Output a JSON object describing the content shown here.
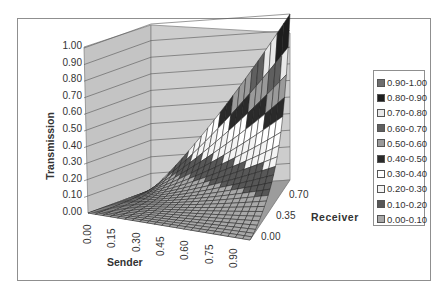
{
  "chart_data": {
    "type": "surface3d",
    "title": "",
    "xlabel": "Sender",
    "ylabel": "Transmission",
    "zlabel": "Receiver",
    "x_ticks": [
      "0.00",
      "0.15",
      "0.30",
      "0.45",
      "0.60",
      "0.75",
      "0.90"
    ],
    "z_ticks": [
      "0.00",
      "0.35",
      "0.70"
    ],
    "y_ticks": [
      "0.00",
      "0.10",
      "0.20",
      "0.30",
      "0.40",
      "0.50",
      "0.60",
      "0.70",
      "0.80",
      "0.90",
      "1.00"
    ],
    "ylim": [
      0,
      1
    ],
    "xlim": [
      0,
      1
    ],
    "zlim": [
      0,
      1
    ],
    "grid": true,
    "legend_position": "right",
    "legend": [
      {
        "label": "0.90-1.00",
        "color": "#6e6e6e"
      },
      {
        "label": "0.80-0.90",
        "color": "#1e1e1e"
      },
      {
        "label": "0.70-0.80",
        "color": "#e8e8e8"
      },
      {
        "label": "0.60-0.70",
        "color": "#5f5f5f"
      },
      {
        "label": "0.50-0.60",
        "color": "#9a9a9a"
      },
      {
        "label": "0.40-0.50",
        "color": "#2a2a2a"
      },
      {
        "label": "0.30-0.40",
        "color": "#ffffff"
      },
      {
        "label": "0.20-0.30",
        "color": "#f4f4f4"
      },
      {
        "label": "0.10-0.20",
        "color": "#575757"
      },
      {
        "label": "0.00-0.10",
        "color": "#a8a8a8"
      }
    ]
  },
  "axis": {
    "y_title": "Transmission",
    "x_title": "Sender",
    "z_title": "Receiver"
  }
}
